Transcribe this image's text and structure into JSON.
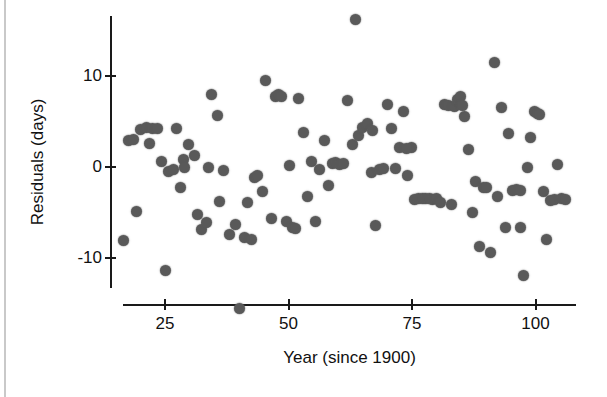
{
  "chart_data": {
    "type": "scatter",
    "title": "",
    "xlabel": "Year (since 1900)",
    "ylabel": "Residuals (days)",
    "xlim": [
      14,
      109
    ],
    "ylim": [
      -16.5,
      17.5
    ],
    "xticks": [
      25,
      50,
      75,
      100
    ],
    "xtick_labels": [
      "25",
      "50",
      "75",
      "100"
    ],
    "yticks": [
      10,
      0,
      -10
    ],
    "ytick_labels": [
      "10",
      "0",
      "-10"
    ],
    "grid": false,
    "legend": null,
    "marker": {
      "shape": "circle",
      "color": "#595959",
      "size_px": 11
    },
    "axis_color": "#1a1a1a",
    "background": "#ffffff",
    "n_points": 121,
    "points": [
      [
        16.7,
        -8.1
      ],
      [
        17.6,
        2.9
      ],
      [
        18.6,
        3.0
      ],
      [
        19.2,
        -4.9
      ],
      [
        20.1,
        4.1
      ],
      [
        21.2,
        4.3
      ],
      [
        21.9,
        2.6
      ],
      [
        22.5,
        4.2
      ],
      [
        23.5,
        4.2
      ],
      [
        24.3,
        0.6
      ],
      [
        25.0,
        -11.3
      ],
      [
        25.8,
        -0.5
      ],
      [
        26.7,
        -0.3
      ],
      [
        27.3,
        4.2
      ],
      [
        28.2,
        -2.3
      ],
      [
        28.8,
        0.8
      ],
      [
        29.8,
        2.5
      ],
      [
        30.9,
        1.3
      ],
      [
        31.6,
        -5.2
      ],
      [
        32.4,
        -6.8
      ],
      [
        33.3,
        -6.1
      ],
      [
        34.5,
        7.9
      ],
      [
        35.6,
        5.6
      ],
      [
        36.8,
        -0.4
      ],
      [
        38.0,
        -7.4
      ],
      [
        39.2,
        -6.3
      ],
      [
        40.1,
        -15.5
      ],
      [
        41.0,
        -7.7
      ],
      [
        41.8,
        -3.9
      ],
      [
        43.1,
        -1.2
      ],
      [
        43.8,
        -0.9
      ],
      [
        44.8,
        -2.7
      ],
      [
        45.4,
        9.5
      ],
      [
        46.6,
        -5.6
      ],
      [
        47.3,
        7.7
      ],
      [
        47.9,
        7.9
      ],
      [
        48.6,
        7.7
      ],
      [
        49.5,
        -6.0
      ],
      [
        50.2,
        0.2
      ],
      [
        50.9,
        -6.6
      ],
      [
        52.1,
        7.5
      ],
      [
        53.0,
        3.8
      ],
      [
        53.8,
        -3.2
      ],
      [
        54.6,
        0.6
      ],
      [
        55.4,
        -6.0
      ],
      [
        56.3,
        -0.3
      ],
      [
        57.2,
        2.9
      ],
      [
        58.1,
        -2.0
      ],
      [
        58.9,
        0.4
      ],
      [
        59.6,
        0.5
      ],
      [
        60.4,
        0.3
      ],
      [
        61.2,
        0.4
      ],
      [
        62.0,
        7.3
      ],
      [
        62.9,
        2.5
      ],
      [
        63.6,
        16.2
      ],
      [
        64.2,
        3.4
      ],
      [
        65.0,
        4.3
      ],
      [
        65.9,
        4.8
      ],
      [
        66.8,
        -0.6
      ],
      [
        67.6,
        -6.4
      ],
      [
        68.5,
        -0.3
      ],
      [
        69.3,
        -0.2
      ],
      [
        70.1,
        6.8
      ],
      [
        70.9,
        4.2
      ],
      [
        71.7,
        -0.2
      ],
      [
        72.4,
        2.1
      ],
      [
        73.2,
        6.1
      ],
      [
        74.0,
        -0.9
      ],
      [
        74.8,
        2.1
      ],
      [
        75.6,
        -3.6
      ],
      [
        76.3,
        -3.5
      ],
      [
        77.1,
        -3.5
      ],
      [
        77.8,
        -3.4
      ],
      [
        78.5,
        -3.4
      ],
      [
        79.2,
        -3.6
      ],
      [
        80.0,
        -3.5
      ],
      [
        80.8,
        -3.9
      ],
      [
        81.6,
        6.8
      ],
      [
        82.3,
        6.7
      ],
      [
        82.9,
        -4.1
      ],
      [
        83.6,
        6.6
      ],
      [
        84.3,
        7.4
      ],
      [
        84.9,
        7.7
      ],
      [
        85.6,
        5.5
      ],
      [
        86.4,
        1.9
      ],
      [
        87.2,
        -5.0
      ],
      [
        87.9,
        -1.6
      ],
      [
        88.6,
        -8.7
      ],
      [
        89.4,
        -2.2
      ],
      [
        90.1,
        -2.2
      ],
      [
        90.8,
        -9.4
      ],
      [
        91.6,
        11.5
      ],
      [
        92.4,
        -3.2
      ],
      [
        93.1,
        6.5
      ],
      [
        93.9,
        -6.6
      ],
      [
        94.6,
        3.7
      ],
      [
        95.4,
        -2.6
      ],
      [
        96.2,
        -2.5
      ],
      [
        96.9,
        -2.6
      ],
      [
        97.6,
        -11.9
      ],
      [
        98.3,
        -0.1
      ],
      [
        99.0,
        3.2
      ],
      [
        99.8,
        6.1
      ],
      [
        100.4,
        5.9
      ],
      [
        100.9,
        5.8
      ],
      [
        101.6,
        -2.7
      ],
      [
        102.3,
        -7.9
      ],
      [
        103.0,
        -3.7
      ],
      [
        103.8,
        -3.6
      ],
      [
        104.5,
        0.3
      ],
      [
        105.3,
        -3.5
      ],
      [
        106.0,
        -3.6
      ],
      [
        29.0,
        -0.1
      ],
      [
        36.0,
        -3.8
      ],
      [
        42.5,
        -7.9
      ],
      [
        51.5,
        -6.7
      ],
      [
        67.0,
        4.0
      ],
      [
        73.8,
        2.0
      ],
      [
        85.2,
        6.7
      ],
      [
        97.0,
        -6.6
      ],
      [
        33.9,
        -0.1
      ]
    ]
  },
  "axes": {
    "x_title": "Year (since 1900)",
    "y_title": "Residuals (days)",
    "x_tick_labels": [
      "25",
      "50",
      "75",
      "100"
    ],
    "y_tick_labels": [
      "10",
      "0",
      "-10"
    ]
  }
}
